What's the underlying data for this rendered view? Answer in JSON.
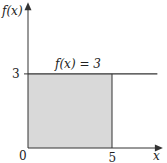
{
  "chart_data": {
    "type": "area",
    "title": "",
    "xlabel": "x",
    "ylabel": "f(x)",
    "function_label": "f(x) = 3",
    "x": [
      0,
      5
    ],
    "series": [
      {
        "name": "f(x) = 3",
        "values": [
          3,
          3
        ]
      }
    ],
    "shaded_region": {
      "x_from": 0,
      "x_to": 5,
      "y_from": 0,
      "y_to": 3
    },
    "line_extends_to_x": 7.7,
    "xlim": [
      0,
      8
    ],
    "ylim": [
      0,
      5.9
    ],
    "x_ticks": [
      {
        "value": 0,
        "label": "0"
      },
      {
        "value": 5,
        "label": "5"
      }
    ],
    "y_ticks": [
      {
        "value": 3,
        "label": "3"
      }
    ],
    "grid": false,
    "legend": "none",
    "colors": {
      "shade": "#d9d9d9",
      "line": "#333333",
      "axis": "#333333"
    }
  }
}
